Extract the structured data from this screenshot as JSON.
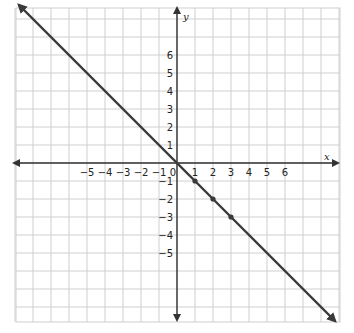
{
  "chart_data": {
    "type": "line",
    "title": "",
    "xlabel": "x",
    "ylabel": "y",
    "xlim": [
      -9,
      9
    ],
    "ylim": [
      -8.5,
      8.7
    ],
    "grid": true,
    "x_tick_labels": [
      "−5",
      "−4",
      "−3",
      "−2",
      "−1",
      "0",
      "1",
      "2",
      "3",
      "4",
      "5",
      "6"
    ],
    "x_ticks": [
      -5,
      -4,
      -3,
      -2,
      -1,
      0,
      1,
      2,
      3,
      4,
      5,
      6
    ],
    "y_tick_labels": [
      "6",
      "5",
      "4",
      "3",
      "2",
      "1",
      "−1",
      "−2",
      "−3",
      "−4",
      "−5"
    ],
    "y_ticks": [
      6,
      5,
      4,
      3,
      2,
      1,
      -1,
      -2,
      -3,
      -4,
      -5
    ],
    "series": [
      {
        "name": "y = -x",
        "equation": "y = -x",
        "x": [
          -8.8,
          8.8
        ],
        "y": [
          8.8,
          -8.8
        ],
        "arrows_both_ends": true,
        "color": "#3a3a3a"
      }
    ],
    "points": [
      {
        "x": 1,
        "y": -1
      },
      {
        "x": 2,
        "y": -2
      },
      {
        "x": 3,
        "y": -3
      }
    ]
  },
  "colors": {
    "grid": "#cfcfcf",
    "axis": "#333333",
    "line": "#3a3a3a",
    "background": "#ffffff"
  }
}
